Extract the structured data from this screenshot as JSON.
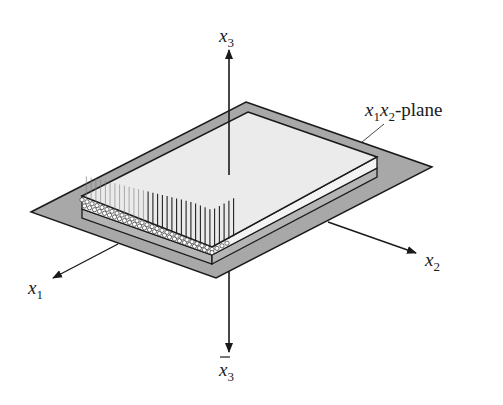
{
  "figure": {
    "type": "3d-axes-diagram",
    "colors": {
      "background": "#ffffff",
      "plane_fill": "#a8a8a8",
      "slab_top": "#ebebeb",
      "slab_upper_layer": "#f4f4f4",
      "slab_lower_layer": "#b4b4b4",
      "stroke": "#1a1a1a"
    }
  },
  "axes": {
    "x3": {
      "base": "x",
      "sub": "3",
      "direction": "up"
    },
    "x3bar": {
      "base": "x",
      "sub": "3",
      "overbar": true,
      "direction": "down"
    },
    "x1": {
      "base": "x",
      "sub": "1",
      "direction": "front-left"
    },
    "x2": {
      "base": "x",
      "sub": "2",
      "direction": "front-right"
    }
  },
  "annotations": {
    "plane_label": {
      "x1": "x",
      "sub1": "1",
      "x2": "x",
      "sub2": "2",
      "suffix": "-plane"
    }
  }
}
